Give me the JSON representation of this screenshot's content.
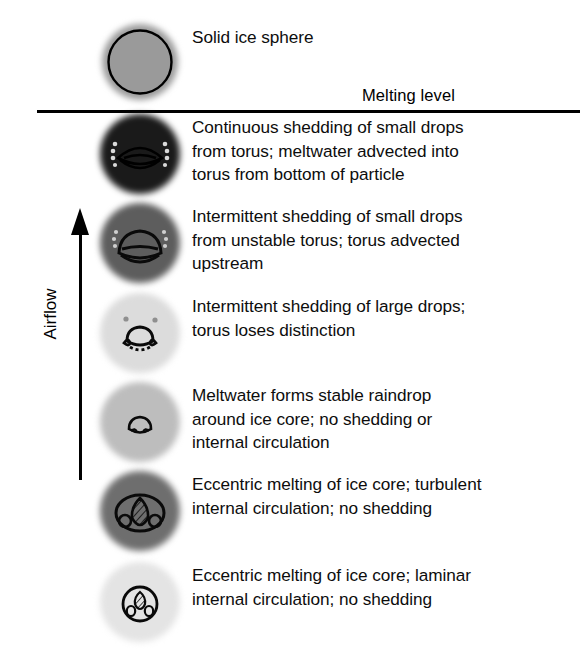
{
  "figure": {
    "melting_level_label": "Melting level",
    "airflow_label": "Airflow",
    "line_color": "#000000",
    "background": "#ffffff",
    "text_color": "#0d0d0d"
  },
  "stages": [
    {
      "id": "solid-ice-sphere",
      "position": "above-melting-level",
      "disc_fill": "#9a9a9a",
      "disc_size": 76,
      "caption_lines": [
        "Solid ice sphere"
      ]
    },
    {
      "id": "continuous-shedding",
      "position": "below-melting-level",
      "disc_fill": "#1a1a1a",
      "disc_size": 80,
      "caption_lines": [
        "Continuous shedding of small drops",
        "from torus; meltwater advected into",
        "torus from bottom of particle"
      ]
    },
    {
      "id": "intermittent-shedding-small-drops",
      "position": "below-melting-level",
      "disc_fill": "#5d5d5d",
      "disc_size": 80,
      "caption_lines": [
        "Intermittent shedding of small drops",
        "from unstable torus; torus advected",
        "upstream"
      ]
    },
    {
      "id": "intermittent-shedding-large-drops",
      "position": "below-melting-level",
      "disc_fill": "#dcdcdc",
      "disc_size": 80,
      "caption_lines": [
        "Intermittent shedding of large drops;",
        "torus loses distinction"
      ]
    },
    {
      "id": "stable-raindrop",
      "position": "below-melting-level",
      "disc_fill": "#bdbdbd",
      "disc_size": 80,
      "caption_lines": [
        "Meltwater forms stable raindrop",
        "around ice core; no shedding or",
        "internal circulation"
      ]
    },
    {
      "id": "eccentric-melting-turbulent",
      "position": "below-melting-level",
      "disc_fill": "#6e6e6e",
      "disc_size": 80,
      "caption_lines": [
        "Eccentric melting of ice core; turbulent",
        "internal circulation; no shedding"
      ]
    },
    {
      "id": "eccentric-melting-laminar",
      "position": "below-melting-level",
      "disc_fill": "#e4e4e4",
      "disc_size": 80,
      "caption_lines": [
        "Eccentric melting of ice core; laminar",
        "internal circulation; no shedding"
      ]
    }
  ]
}
